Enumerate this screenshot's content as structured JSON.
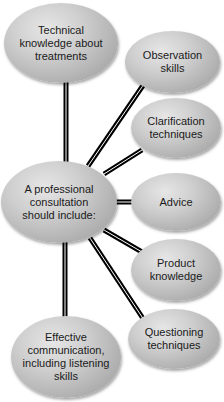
{
  "diagram": {
    "type": "hub-and-spoke mind map",
    "central": {
      "id": "central",
      "label": "A professional consultation should include:"
    },
    "nodes": [
      {
        "id": "technical",
        "label": "Technical knowledge about treatments"
      },
      {
        "id": "observation",
        "label": "Observation skills"
      },
      {
        "id": "clarification",
        "label": "Clarification techniques"
      },
      {
        "id": "advice",
        "label": "Advice"
      },
      {
        "id": "product",
        "label": "Product knowledge"
      },
      {
        "id": "questioning",
        "label": "Questioning techniques"
      },
      {
        "id": "effective",
        "label": "Effective communication, including listening skills"
      }
    ],
    "edges": [
      [
        "central",
        "technical"
      ],
      [
        "central",
        "observation"
      ],
      [
        "central",
        "clarification"
      ],
      [
        "central",
        "advice"
      ],
      [
        "central",
        "product"
      ],
      [
        "central",
        "questioning"
      ],
      [
        "central",
        "effective"
      ]
    ],
    "colors": {
      "node_fill": "#c4c4c4",
      "node_highlight": "#e6e6e6",
      "node_shade": "#8e8e8e",
      "connector": "#000000",
      "connector_gap": "#ffffff",
      "text": "#1a1a1a",
      "background": "#ffffff"
    }
  }
}
